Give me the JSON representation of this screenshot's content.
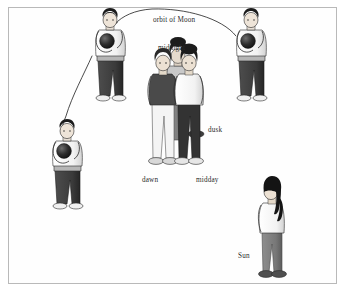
{
  "figure": {
    "domain": "diagram",
    "kind": "science-illustration",
    "background_color": "#ffffff",
    "frame_color": "#b9b9b9",
    "ink_color": "#2b2b2b"
  },
  "labels": [
    {
      "id": "orbit-of-moon",
      "text": "orbit of Moon",
      "x": 153,
      "y": 16
    },
    {
      "id": "midnight",
      "text": "midnight",
      "x": 158,
      "y": 44
    },
    {
      "id": "dusk",
      "text": "dusk",
      "x": 208,
      "y": 126
    },
    {
      "id": "dawn",
      "text": "dawn",
      "x": 142,
      "y": 176
    },
    {
      "id": "midday",
      "text": "midday",
      "x": 196,
      "y": 176
    },
    {
      "id": "sun",
      "text": "Sun",
      "x": 238,
      "y": 252
    }
  ],
  "people": [
    {
      "id": "moon-person-top-left",
      "role": "Moon (position 2)",
      "holds": "dark ball held against chest",
      "shirt_color": "#fdfdfd",
      "trouser_color": "#3a3a3a",
      "hair_color": "#1c1c1c",
      "shoe_color": "#efefef"
    },
    {
      "id": "moon-person-right",
      "role": "Moon (position 1, start of orbit)",
      "holds": "dark ball held against chest",
      "shirt_color": "#fdfdfd",
      "trouser_color": "#3a3a3a",
      "hair_color": "#1c1c1c",
      "shoe_color": "#efefef"
    },
    {
      "id": "moon-person-bottom-left",
      "role": "Moon (position 3)",
      "holds": "dark ball held against chest",
      "shirt_color": "#fdfdfd",
      "trouser_color": "#3a3a3a",
      "hair_color": "#1c1c1c",
      "shoe_color": "#efefef"
    },
    {
      "id": "earth-person-dawn",
      "role": "Earth observer at dawn",
      "shirt_color": "#4a4a4a",
      "trouser_color": "#f4f4f4",
      "hair_color": "#1c1c1c"
    },
    {
      "id": "earth-person-midnight",
      "role": "Earth observer at midnight (behind)",
      "shirt_color": "#c9c9c9",
      "trouser_color": "#6d6d6d",
      "hair_color": "#1c1c1c"
    },
    {
      "id": "earth-person-midday",
      "role": "Earth observer at midday",
      "shirt_color": "#fdfdfd",
      "trouser_color": "#333333",
      "hair_color": "#1c1c1c"
    },
    {
      "id": "sun-person",
      "role": "Sun",
      "shirt_color": "#fdfdfd",
      "trouser_color": "#7c7c7c",
      "hair_color": "#141414",
      "hair_style": "long ponytail"
    }
  ],
  "arrows": [
    {
      "id": "orbit-arc-top",
      "description": "curved arrow from right Moon person over the top to the upper-left Moon person",
      "arrowhead_at": "upper-left"
    },
    {
      "id": "orbit-arc-left",
      "description": "curved arrow from upper-left Moon person down to the lower-left Moon person",
      "arrowhead_at": "lower-left"
    }
  ]
}
